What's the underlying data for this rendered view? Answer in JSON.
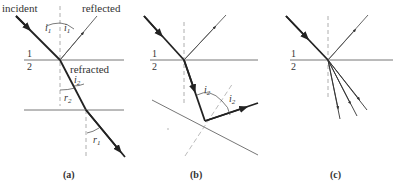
{
  "panels": [
    {
      "id": "a",
      "caption": "(a)",
      "labels": {
        "incident": "incident",
        "reflected": "reflected",
        "refracted": "refracted",
        "medium_top": "1",
        "medium_bottom": "2",
        "angle_incident": "i",
        "angle_incident_sub": "1",
        "angle_reflected": "i",
        "angle_reflected_sub": "1",
        "angle_i2": "i",
        "angle_i2_sub": "2",
        "angle_r2": "r",
        "angle_r2_sub": "2",
        "angle_r1": "r",
        "angle_r1_sub": "1"
      }
    },
    {
      "id": "b",
      "caption": "(b)",
      "labels": {
        "medium_top": "1",
        "medium_bottom": "2",
        "angle_a": "i",
        "angle_a_sub": "2",
        "angle_b": "i",
        "angle_b_sub": "2"
      }
    },
    {
      "id": "c",
      "caption": "(c)",
      "labels": {
        "medium_top": "1",
        "medium_bottom": "2"
      }
    }
  ],
  "colors": {
    "ray": "#222222",
    "interface": "#666666",
    "normal": "#999999",
    "text": "#333333"
  }
}
